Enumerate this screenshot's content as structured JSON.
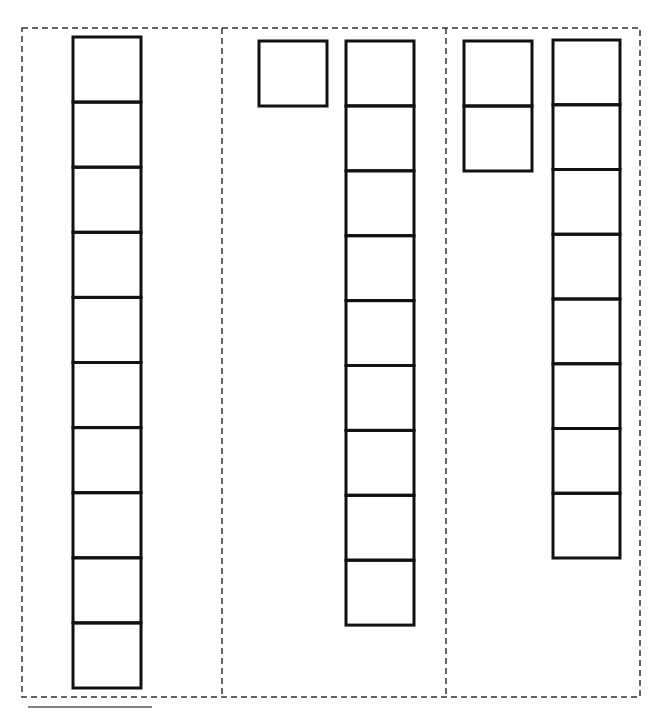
{
  "diagram": {
    "frame": {
      "x": 22,
      "y": 28,
      "w": 618,
      "h": 669,
      "stroke": "#333333"
    },
    "dividers": [
      222,
      446
    ],
    "panels": [
      {
        "name": "panel-1",
        "stacks": [
          {
            "x": 73,
            "y": 37,
            "w": 68,
            "cell": 65.1,
            "count": 10
          }
        ]
      },
      {
        "name": "panel-2",
        "stacks": [
          {
            "x": 259,
            "y": 41,
            "w": 68,
            "cell": 65,
            "count": 1
          },
          {
            "x": 346,
            "y": 41,
            "w": 68,
            "cell": 64.9,
            "count": 9
          }
        ]
      },
      {
        "name": "panel-3",
        "stacks": [
          {
            "x": 464,
            "y": 41,
            "w": 68,
            "cell": 65,
            "count": 2
          },
          {
            "x": 553,
            "y": 40,
            "w": 67,
            "cell": 64.75,
            "count": 8
          }
        ]
      }
    ],
    "underline": {
      "x1": 28,
      "x2": 152,
      "y": 707
    },
    "colors": {
      "block_stroke": "#111111",
      "dash_stroke": "#333333",
      "background": "#ffffff"
    }
  }
}
